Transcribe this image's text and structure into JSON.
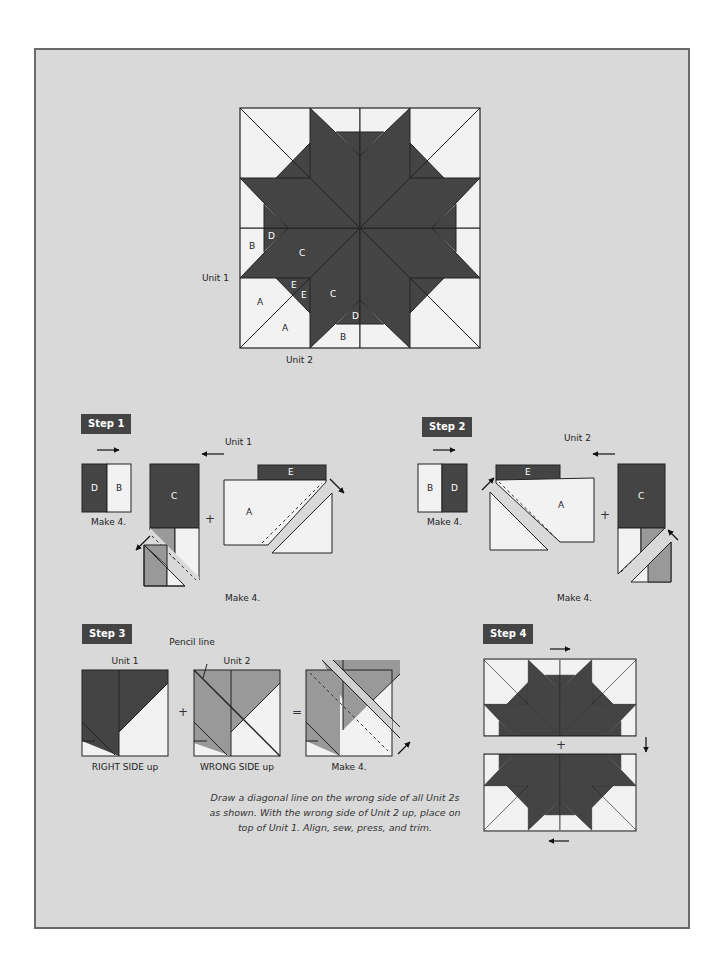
{
  "colors": {
    "background": "#d9d9d9",
    "dark": "#444444",
    "medium": "#999999",
    "light": "#f2f2f2",
    "outline": "#222222"
  },
  "main_block": {
    "labels": {
      "unit1": "Unit 1",
      "unit2": "Unit 2",
      "pieces": [
        "B",
        "D",
        "C",
        "E",
        "E",
        "A",
        "A",
        "C",
        "D",
        "B"
      ]
    }
  },
  "step1": {
    "badge": "Step 1",
    "unit_label": "Unit 1",
    "pair": {
      "left": "D",
      "right": "B",
      "make": "Make 4."
    },
    "piece_c": "C",
    "piece_e": "E",
    "piece_a": "A",
    "plus": "+",
    "make": "Make 4."
  },
  "step2": {
    "badge": "Step 2",
    "unit_label": "Unit 2",
    "pair": {
      "left": "B",
      "right": "D",
      "make": "Make 4."
    },
    "piece_e": "E",
    "piece_a": "A",
    "piece_c": "C",
    "plus": "+",
    "make": "Make 4."
  },
  "step3": {
    "badge": "Step 3",
    "pencil_line": "Pencil line",
    "unit1": "Unit 1",
    "unit2": "Unit 2",
    "right_side": "RIGHT SIDE up",
    "wrong_side": "WRONG SIDE up",
    "plus": "+",
    "equals": "=",
    "make": "Make 4.",
    "caption": [
      "Draw a diagonal line on the wrong side of all Unit 2s",
      "as shown. With the wrong side of Unit 2 up, place on",
      "top of Unit 1. Align, sew, press, and trim."
    ]
  },
  "step4": {
    "badge": "Step 4",
    "plus": "+"
  }
}
